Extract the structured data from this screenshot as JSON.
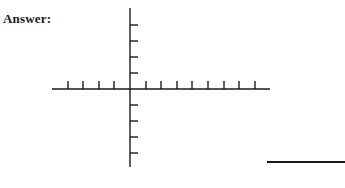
{
  "prompt": {
    "answer_label": "Answer:"
  },
  "graph": {
    "type": "blank-coordinate-axes",
    "origin": {
      "x": 130,
      "y": 89
    },
    "x_axis": {
      "from": 52,
      "to": 270,
      "tick_count_left": 4,
      "tick_count_right": 8,
      "tick_spacing": 15.6,
      "tick_direction": "up",
      "tick_length": 8
    },
    "y_axis": {
      "from": 8,
      "to": 167,
      "tick_count_up": 4,
      "tick_count_down": 4,
      "tick_spacing": 16,
      "tick_direction": "right",
      "tick_length": 8
    },
    "stroke_color": "#1a1a1a"
  },
  "answer_blank": {
    "label": ""
  }
}
